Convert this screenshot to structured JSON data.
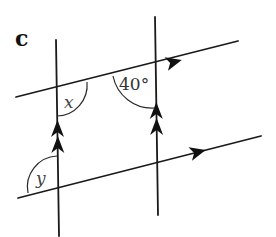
{
  "figure": {
    "part_label": "c",
    "angles": {
      "x_label": "x",
      "given_label": "40°",
      "y_label": "y"
    },
    "colors": {
      "line": "#1a1a1a",
      "background": "#ffffff"
    }
  }
}
